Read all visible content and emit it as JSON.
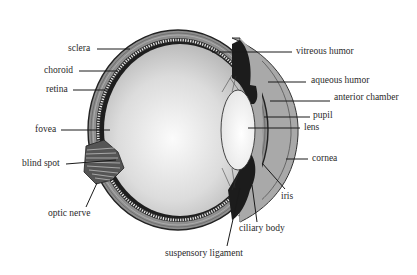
{
  "figure": {
    "labels_left": [
      {
        "id": "sclera",
        "text": "sclera"
      },
      {
        "id": "choroid",
        "text": "choroid"
      },
      {
        "id": "retina",
        "text": "retina"
      },
      {
        "id": "fovea",
        "text": "fovea"
      },
      {
        "id": "blind-spot",
        "text": "blind spot"
      },
      {
        "id": "optic-nerve",
        "text": "optic nerve"
      }
    ],
    "labels_right": [
      {
        "id": "vitreous-humor",
        "text": "vitreous humor"
      },
      {
        "id": "aqueous-humor",
        "text": "aqueous humor"
      },
      {
        "id": "anterior-chamber",
        "text": "anterior chamber"
      },
      {
        "id": "pupil",
        "text": "pupil"
      },
      {
        "id": "lens",
        "text": "lens"
      },
      {
        "id": "cornea",
        "text": "cornea"
      }
    ],
    "labels_bottom": [
      {
        "id": "iris",
        "text": "iris"
      },
      {
        "id": "ciliary-body",
        "text": "ciliary body"
      },
      {
        "id": "suspensory-ligament",
        "text": "suspensory ligament"
      }
    ],
    "colors": {
      "background": "#ffffff",
      "text": "#2a2a2a",
      "leader_line": "#1a1a1a",
      "sclera": "#9a9a9a",
      "vitreous_center": "#f6f6f6",
      "vitreous_edge": "#b8b8b8",
      "aqueous": "#a8a8a8",
      "iris_ciliary": "#1c1c1c",
      "lens": "#f2f2f2"
    }
  }
}
